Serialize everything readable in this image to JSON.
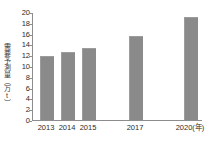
{
  "chart_data": {
    "type": "bar",
    "title": "",
    "subtitle": "",
    "xlabel": "年",
    "ylabel": "需要予測量（万t）",
    "categories": [
      "2013",
      "2014",
      "2015",
      "2017",
      "2020"
    ],
    "x_tick_labels": [
      "2013",
      "2014",
      "2015",
      "2017",
      "2020(年)"
    ],
    "values": [
      11.6,
      12.4,
      13.2,
      15.3,
      18.9
    ],
    "ylim": [
      0,
      20
    ],
    "ytick_step": 2,
    "y_tick_labels": [
      "20",
      "18",
      "16",
      "14",
      "12",
      "10",
      "8",
      "6",
      "4",
      "2",
      "0"
    ],
    "grid": false,
    "legend": "none",
    "bar_color": "#8a8a8a",
    "axis_color": "#8d8d8d",
    "text_color": "#2b2b2b",
    "background": "#ffffff"
  }
}
